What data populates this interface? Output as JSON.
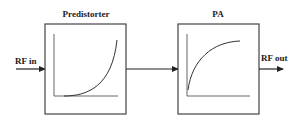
{
  "diagram": {
    "type": "block-diagram",
    "stroke_color": "#333333",
    "blocks": [
      {
        "id": "predistorter",
        "title": "Predistorter",
        "curve": "expanding",
        "curve_description": "convex exponential rise"
      },
      {
        "id": "pa",
        "title": "PA",
        "curve": "compressing",
        "curve_description": "concave saturating rise"
      }
    ],
    "input_label": "RF in",
    "output_label": "RF out",
    "connections": [
      {
        "from": "RF in",
        "to": "Predistorter"
      },
      {
        "from": "Predistorter",
        "to": "PA"
      },
      {
        "from": "PA",
        "to": "RF out"
      }
    ]
  }
}
